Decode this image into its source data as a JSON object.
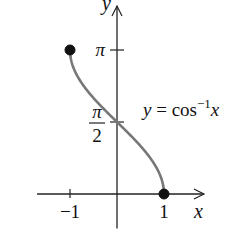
{
  "chart_data": {
    "type": "line",
    "title": "",
    "function_label": "y = cos⁻¹x",
    "function_label_parts": {
      "lhs": "y",
      "eq": " = cos",
      "sup": "−1",
      "arg": "x"
    },
    "xlabel": "x",
    "ylabel": "y",
    "xlim": [
      -1.7,
      1.85
    ],
    "ylim": [
      -0.75,
      4.1
    ],
    "x_ticks": [
      {
        "value": -1,
        "label": "−1"
      },
      {
        "value": 1,
        "label": "1"
      }
    ],
    "y_ticks": [
      {
        "value": 3.14159,
        "label": "π"
      },
      {
        "value": 1.5708,
        "label_num": "π",
        "label_den": "2"
      }
    ],
    "series": [
      {
        "name": "arccos",
        "color": "#777777",
        "domain": [
          -1,
          1
        ]
      }
    ],
    "endpoints": [
      {
        "x": -1,
        "y": 3.14159,
        "filled": true
      },
      {
        "x": 1,
        "y": 0,
        "filled": true
      }
    ],
    "grid": false
  }
}
